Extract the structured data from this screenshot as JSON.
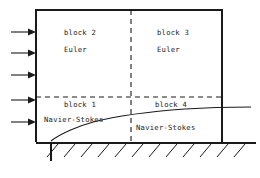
{
  "figure": {
    "type": "schematic-diagram",
    "width": 260,
    "height": 178,
    "background_color": "#ffffff",
    "line_color": "#1a1a1a"
  },
  "blocks": [
    {
      "id": "block-2",
      "name": "block 2",
      "equations": "Euler",
      "quadrant": "upper-left",
      "label_x": 64,
      "label_y": 35,
      "eq_x": 64,
      "eq_y": 52
    },
    {
      "id": "block-3",
      "name": "block 3",
      "equations": "Euler",
      "quadrant": "upper-right",
      "label_x": 157,
      "label_y": 35,
      "eq_x": 157,
      "eq_y": 52
    },
    {
      "id": "block-1",
      "name": "block 1",
      "equations": "Navier-Stokes",
      "quadrant": "lower-left",
      "label_x": 64,
      "label_y": 107,
      "eq_x": 47,
      "eq_y": 122
    },
    {
      "id": "block-4",
      "name": "block 4",
      "equations": "Navier-Stokes",
      "quadrant": "lower-right",
      "label_x": 155,
      "label_y": 107,
      "eq_x": 139,
      "eq_y": 130
    }
  ],
  "domain_box": {
    "x": 36,
    "y": 10,
    "width": 186,
    "height": 132,
    "right": 222,
    "bottom": 142
  },
  "dividers": {
    "vertical_dashed": {
      "x": 131,
      "y1": 10,
      "y2": 142
    },
    "horizontal_dashed": {
      "y": 97,
      "x1": 36,
      "x2": 222
    }
  },
  "inflow_arrows": {
    "count": 5,
    "label": "inflow",
    "direction": "right",
    "x_start": 11,
    "x_end": 36,
    "y_positions": [
      32,
      53,
      75,
      100,
      122
    ]
  },
  "boundary_layer_curve": {
    "label": "boundary layer edge",
    "start": {
      "x": 51,
      "y": 141
    },
    "end": {
      "x": 251,
      "y": 107
    },
    "passes_through": [
      {
        "x": 51,
        "y": 141
      },
      {
        "x": 70,
        "y": 130
      },
      {
        "x": 95,
        "y": 122
      },
      {
        "x": 131,
        "y": 115
      },
      {
        "x": 175,
        "y": 110
      },
      {
        "x": 222,
        "y": 107.5
      },
      {
        "x": 251,
        "y": 107
      }
    ]
  },
  "wall": {
    "label": "solid wall (hatched)",
    "baseline_y": 143,
    "x_start": 36,
    "x_end": 256,
    "hatch_count": 12,
    "hatch_spacing": 17,
    "hatch_length": 15,
    "hatch_angle_deg": 45,
    "leading_edge_drop": {
      "x": 51,
      "y1": 143,
      "y2": 161
    }
  }
}
